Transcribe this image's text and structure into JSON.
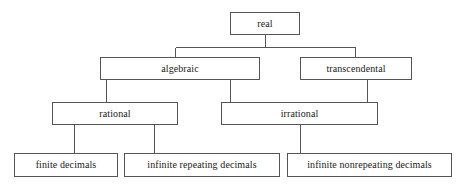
{
  "diagram": {
    "type": "hierarchy-tree",
    "style": {
      "background": "#ffffff",
      "box_border_color": "#555555",
      "box_fill_color": "#ffffff",
      "connector_color": "#555555",
      "text_color": "#1a1a1a"
    },
    "nodes": {
      "real": {
        "label": "real",
        "level": 1
      },
      "algebraic": {
        "label": "algebraic",
        "level": 2
      },
      "transcendental": {
        "label": "transcendental",
        "level": 2
      },
      "rational": {
        "label": "rational",
        "level": 3
      },
      "irrational": {
        "label": "irrational",
        "level": 3
      },
      "finite_decimals": {
        "label": "finite decimals",
        "level": 4
      },
      "infinite_repeating_decimals": {
        "label": "infinite repeating decimals",
        "level": 4
      },
      "infinite_nonrepeating_decimals": {
        "label": "infinite nonrepeating decimals",
        "level": 4
      }
    },
    "edges": [
      {
        "from": "real",
        "to": "algebraic"
      },
      {
        "from": "real",
        "to": "transcendental"
      },
      {
        "from": "algebraic",
        "to": "rational"
      },
      {
        "from": "algebraic",
        "to": "irrational"
      },
      {
        "from": "transcendental",
        "to": "irrational"
      },
      {
        "from": "rational",
        "to": "finite_decimals"
      },
      {
        "from": "rational",
        "to": "infinite_repeating_decimals"
      },
      {
        "from": "irrational",
        "to": "infinite_nonrepeating_decimals"
      }
    ]
  }
}
